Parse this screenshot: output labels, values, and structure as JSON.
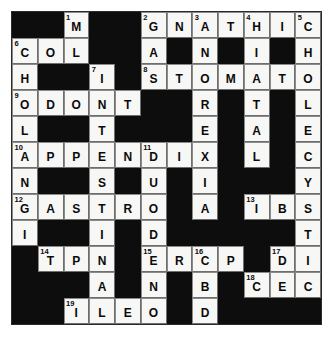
{
  "puzzle": {
    "type": "crossword",
    "rows": 12,
    "cols": 12,
    "block_color": "#0d0d0d",
    "open_color": "#f7f7f5",
    "letter_color": "#0a0a0a",
    "grid": [
      [
        {
          "state": "block"
        },
        {
          "state": "block"
        },
        {
          "state": "open",
          "number": "1",
          "letter": "M"
        },
        {
          "state": "block"
        },
        {
          "state": "block"
        },
        {
          "state": "open",
          "number": "2",
          "letter": "G"
        },
        {
          "state": "open",
          "letter": "N"
        },
        {
          "state": "open",
          "number": "3",
          "letter": "A"
        },
        {
          "state": "open",
          "letter": "T"
        },
        {
          "state": "open",
          "number": "4",
          "letter": "H"
        },
        {
          "state": "open",
          "letter": "I"
        },
        {
          "state": "open",
          "number": "5",
          "letter": "C"
        }
      ],
      [
        {
          "state": "open",
          "number": "6",
          "letter": "C"
        },
        {
          "state": "open",
          "letter": "O"
        },
        {
          "state": "open",
          "letter": "L"
        },
        {
          "state": "block"
        },
        {
          "state": "block"
        },
        {
          "state": "open",
          "letter": "A"
        },
        {
          "state": "block"
        },
        {
          "state": "open",
          "letter": "N"
        },
        {
          "state": "block"
        },
        {
          "state": "open",
          "letter": "I"
        },
        {
          "state": "block"
        },
        {
          "state": "open",
          "letter": "H"
        }
      ],
      [
        {
          "state": "open",
          "letter": "H"
        },
        {
          "state": "block"
        },
        {
          "state": "block"
        },
        {
          "state": "open",
          "number": "7",
          "letter": "I"
        },
        {
          "state": "block"
        },
        {
          "state": "open",
          "number": "8",
          "letter": "S"
        },
        {
          "state": "open",
          "letter": "T"
        },
        {
          "state": "open",
          "letter": "O"
        },
        {
          "state": "open",
          "letter": "M"
        },
        {
          "state": "open",
          "letter": "A"
        },
        {
          "state": "open",
          "letter": "T"
        },
        {
          "state": "open",
          "letter": "O"
        }
      ],
      [
        {
          "state": "open",
          "number": "9",
          "letter": "O"
        },
        {
          "state": "open",
          "letter": "D"
        },
        {
          "state": "open",
          "letter": "O"
        },
        {
          "state": "open",
          "letter": "N"
        },
        {
          "state": "open",
          "letter": "T"
        },
        {
          "state": "block"
        },
        {
          "state": "block"
        },
        {
          "state": "open",
          "letter": "R"
        },
        {
          "state": "block"
        },
        {
          "state": "open",
          "letter": "T"
        },
        {
          "state": "block"
        },
        {
          "state": "open",
          "letter": "L"
        }
      ],
      [
        {
          "state": "open",
          "letter": "L"
        },
        {
          "state": "block"
        },
        {
          "state": "block"
        },
        {
          "state": "open",
          "letter": "T"
        },
        {
          "state": "block"
        },
        {
          "state": "block"
        },
        {
          "state": "block"
        },
        {
          "state": "open",
          "letter": "E"
        },
        {
          "state": "block"
        },
        {
          "state": "open",
          "letter": "A"
        },
        {
          "state": "block"
        },
        {
          "state": "open",
          "letter": "E"
        }
      ],
      [
        {
          "state": "open",
          "number": "10",
          "letter": "A"
        },
        {
          "state": "open",
          "letter": "P"
        },
        {
          "state": "open",
          "letter": "P"
        },
        {
          "state": "open",
          "letter": "E"
        },
        {
          "state": "open",
          "letter": "N"
        },
        {
          "state": "open",
          "number": "11",
          "letter": "D"
        },
        {
          "state": "open",
          "letter": "I"
        },
        {
          "state": "open",
          "letter": "X"
        },
        {
          "state": "block"
        },
        {
          "state": "open",
          "letter": "L"
        },
        {
          "state": "block"
        },
        {
          "state": "open",
          "letter": "C"
        }
      ],
      [
        {
          "state": "open",
          "letter": "N"
        },
        {
          "state": "block"
        },
        {
          "state": "block"
        },
        {
          "state": "open",
          "letter": "S"
        },
        {
          "state": "block"
        },
        {
          "state": "open",
          "letter": "U"
        },
        {
          "state": "block"
        },
        {
          "state": "open",
          "letter": "I"
        },
        {
          "state": "block"
        },
        {
          "state": "block"
        },
        {
          "state": "block"
        },
        {
          "state": "open",
          "letter": "Y"
        }
      ],
      [
        {
          "state": "open",
          "number": "12",
          "letter": "G"
        },
        {
          "state": "open",
          "letter": "A"
        },
        {
          "state": "open",
          "letter": "S"
        },
        {
          "state": "open",
          "letter": "T"
        },
        {
          "state": "open",
          "letter": "R"
        },
        {
          "state": "open",
          "letter": "O"
        },
        {
          "state": "block"
        },
        {
          "state": "open",
          "letter": "A"
        },
        {
          "state": "block"
        },
        {
          "state": "open",
          "number": "13",
          "letter": "I"
        },
        {
          "state": "open",
          "letter": "B"
        },
        {
          "state": "open",
          "letter": "S"
        }
      ],
      [
        {
          "state": "open",
          "letter": "I"
        },
        {
          "state": "block"
        },
        {
          "state": "block"
        },
        {
          "state": "open",
          "letter": "I"
        },
        {
          "state": "block"
        },
        {
          "state": "open",
          "letter": "D"
        },
        {
          "state": "block"
        },
        {
          "state": "block"
        },
        {
          "state": "block"
        },
        {
          "state": "block"
        },
        {
          "state": "block"
        },
        {
          "state": "open",
          "letter": "T"
        }
      ],
      [
        {
          "state": "block"
        },
        {
          "state": "open",
          "number": "14",
          "letter": "T"
        },
        {
          "state": "open",
          "letter": "P"
        },
        {
          "state": "open",
          "letter": "N"
        },
        {
          "state": "block"
        },
        {
          "state": "open",
          "number": "15",
          "letter": "E"
        },
        {
          "state": "open",
          "letter": "R"
        },
        {
          "state": "open",
          "number": "16",
          "letter": "C"
        },
        {
          "state": "open",
          "letter": "P"
        },
        {
          "state": "block"
        },
        {
          "state": "open",
          "number": "17",
          "letter": "D"
        },
        {
          "state": "open",
          "letter": "I"
        }
      ],
      [
        {
          "state": "block"
        },
        {
          "state": "block"
        },
        {
          "state": "block"
        },
        {
          "state": "open",
          "letter": "A"
        },
        {
          "state": "block"
        },
        {
          "state": "open",
          "letter": "N"
        },
        {
          "state": "block"
        },
        {
          "state": "open",
          "letter": "B"
        },
        {
          "state": "block"
        },
        {
          "state": "open",
          "number": "18",
          "letter": "C"
        },
        {
          "state": "open",
          "letter": "E"
        },
        {
          "state": "open",
          "letter": "C"
        }
      ],
      [
        {
          "state": "block"
        },
        {
          "state": "block"
        },
        {
          "state": "open",
          "number": "19",
          "letter": "I"
        },
        {
          "state": "open",
          "letter": "L"
        },
        {
          "state": "open",
          "letter": "E"
        },
        {
          "state": "open",
          "letter": "O"
        },
        {
          "state": "block"
        },
        {
          "state": "open",
          "letter": "D"
        },
        {
          "state": "block"
        },
        {
          "state": "block"
        },
        {
          "state": "block"
        },
        {
          "state": "block"
        }
      ]
    ]
  }
}
